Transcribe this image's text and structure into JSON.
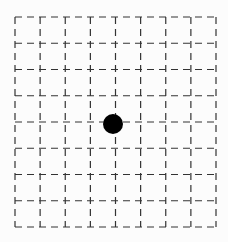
{
  "diagram": {
    "type": "dashed-grid-with-point",
    "grid": {
      "columns": 8,
      "rows": 8,
      "left": 15,
      "top": 17,
      "right": 216,
      "bottom": 227,
      "line_color": "#333333",
      "dash": "7,5",
      "stroke_width": 1.2
    },
    "point": {
      "column_index": 4,
      "row_index": 4,
      "cx": 113,
      "cy": 124,
      "radius": 10,
      "color": "#000000"
    },
    "background": "#fcfcfc"
  }
}
